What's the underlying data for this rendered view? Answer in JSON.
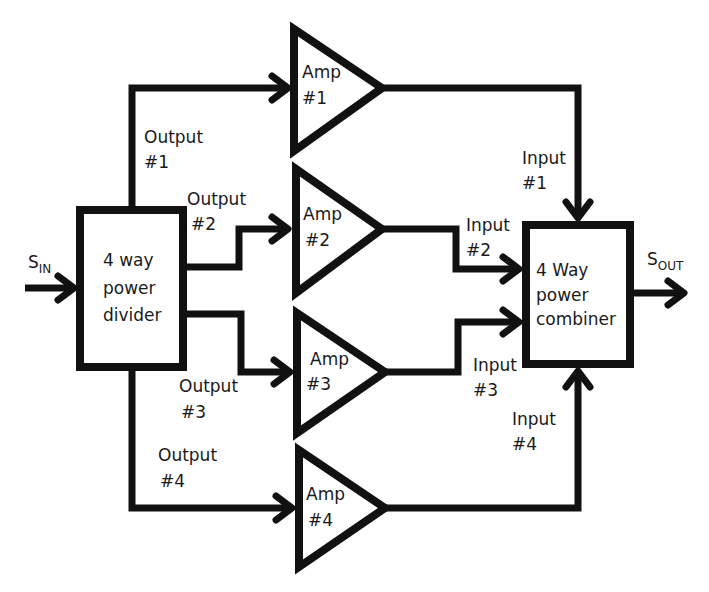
{
  "diagram": {
    "input_signal": {
      "main": "S",
      "sub": "IN"
    },
    "output_signal": {
      "main": "S",
      "sub": "OUT"
    },
    "divider": {
      "line1": "4 way",
      "line2": "power",
      "line3": "divider"
    },
    "combiner": {
      "line1": "4 Way",
      "line2": "power",
      "line3": "combiner"
    },
    "amplifiers": [
      {
        "line1": "Amp",
        "line2": "#1"
      },
      {
        "line1": "Amp",
        "line2": "#2"
      },
      {
        "line1": "Amp",
        "line2": "#3"
      },
      {
        "line1": "Amp",
        "line2": "#4"
      }
    ],
    "outputs": [
      {
        "line1": "Output",
        "line2": "#1"
      },
      {
        "line1": "Output",
        "line2": "#2"
      },
      {
        "line1": "Output",
        "line2": "#3"
      },
      {
        "line1": "Output",
        "line2": "#4"
      }
    ],
    "inputs": [
      {
        "line1": "Input",
        "line2": "#1"
      },
      {
        "line1": "Input",
        "line2": "#2"
      },
      {
        "line1": "Input",
        "line2": "#3"
      },
      {
        "line1": "Input",
        "line2": "#4"
      }
    ],
    "colors": {
      "stroke": "#111111",
      "background": "#ffffff",
      "text": "#1a1a1a"
    }
  }
}
